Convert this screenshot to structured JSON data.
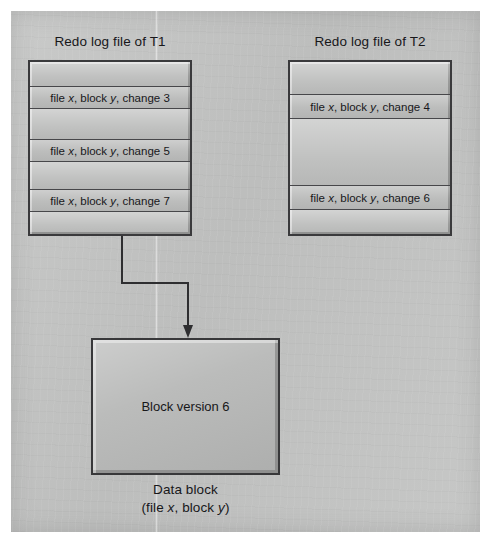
{
  "figure": {
    "title_t1": "Redo log file of T1",
    "title_t2": "Redo log file of T2",
    "data_block_value": "Block version 6",
    "data_block_caption_line1": "Data block",
    "data_block_caption_line2_prefix": "(file ",
    "data_block_caption_x": "x",
    "data_block_caption_mid": ", block ",
    "data_block_caption_y": "y",
    "data_block_caption_suffix": ")",
    "colors": {
      "page_background": "#ffffff",
      "panel_fill": "#c3c4c3",
      "box_fill": "#bdbebd",
      "box_border": "#3a3a3c",
      "text": "#17171a",
      "connector": "#2e2e30"
    }
  },
  "t1_log": {
    "title": "Redo log file of T1",
    "rows": [
      {
        "type": "blank",
        "text": ""
      },
      {
        "type": "entry",
        "prefix": "file ",
        "x": "x",
        "mid": ", block ",
        "y": "y",
        "suffix": ", change 3"
      },
      {
        "type": "blank",
        "text": ""
      },
      {
        "type": "entry",
        "prefix": "file ",
        "x": "x",
        "mid": ", block ",
        "y": "y",
        "suffix": ", change 5"
      },
      {
        "type": "blank",
        "text": ""
      },
      {
        "type": "entry",
        "prefix": "file ",
        "x": "x",
        "mid": ", block ",
        "y": "y",
        "suffix": ", change 7"
      },
      {
        "type": "blank",
        "text": ""
      }
    ]
  },
  "t2_log": {
    "title": "Redo log file of T2",
    "rows": [
      {
        "type": "blank",
        "text": ""
      },
      {
        "type": "entry",
        "prefix": "file ",
        "x": "x",
        "mid": ", block ",
        "y": "y",
        "suffix": ", change 4"
      },
      {
        "type": "blank",
        "text": ""
      },
      {
        "type": "entry",
        "prefix": "file ",
        "x": "x",
        "mid": ", block ",
        "y": "y",
        "suffix": ", change 6"
      },
      {
        "type": "blank",
        "text": ""
      }
    ]
  },
  "data_block": {
    "value": "Block version 6",
    "caption_line1": "Data block",
    "caption_line2": "(file x, block y)"
  },
  "connector": {
    "from": "t1-log-bottom",
    "to": "data-block-top",
    "arrow": "down-arrow"
  }
}
